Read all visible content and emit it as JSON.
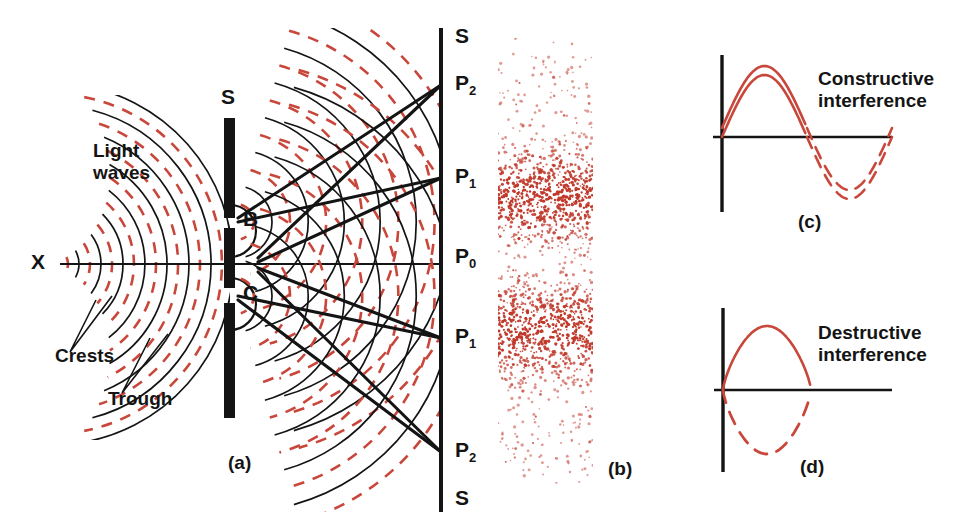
{
  "figure": {
    "background": "#ffffff",
    "ink": "#141414",
    "wave_red": "#c9463a",
    "stipple_red": "#c0392b"
  },
  "panel_a": {
    "caption": "(a)",
    "source_label": "X",
    "barrier_label_top": "S",
    "light_waves_label": "Light\nwaves",
    "crests_label": "Crests",
    "trough_label": "Trough",
    "slit_upper_label": "B",
    "slit_lower_label": "C",
    "screen_labels": [
      {
        "text": "S",
        "sub": "",
        "y": 38
      },
      {
        "text": "P",
        "sub": "2",
        "y": 85
      },
      {
        "text": "P",
        "sub": "1",
        "y": 178
      },
      {
        "text": "P",
        "sub": "0",
        "y": 258
      },
      {
        "text": "P",
        "sub": "1",
        "y": 338
      },
      {
        "text": "P",
        "sub": "2",
        "y": 452
      },
      {
        "text": "S",
        "sub": "",
        "y": 500
      }
    ],
    "geometry": {
      "source_x": 52,
      "axis_y": 264,
      "barrier_x": 230,
      "barrier_top": 118,
      "barrier_bottom": 418,
      "slit_b_y": 222,
      "slit_c_y": 296,
      "screen_x": 441,
      "screen_top": 28,
      "screen_bottom": 512,
      "wavefront_spacing": 22
    }
  },
  "panel_b": {
    "caption": "(b)",
    "description": "Stippled interference fringe pattern on screen",
    "geometry": {
      "x": 498,
      "y": 38,
      "width": 95,
      "height": 448
    },
    "bright_bands": [
      {
        "center_y": 196,
        "half_height": 34
      },
      {
        "center_y": 330,
        "half_height": 34
      }
    ]
  },
  "panel_c": {
    "caption": "(c)",
    "label": "Constructive\ninterference",
    "geometry": {
      "axis_x": 722,
      "axis_top": 55,
      "axis_bottom": 212,
      "baseline_y": 137,
      "baseline_end": 892
    }
  },
  "panel_d": {
    "caption": "(d)",
    "label": "Destructive\ninterference",
    "geometry": {
      "axis_x": 723,
      "axis_top": 308,
      "axis_bottom": 472,
      "baseline_y": 390,
      "baseline_end": 892
    }
  },
  "chart_data": {
    "type": "line",
    "panels": [
      {
        "id": "a",
        "caption": "(a)",
        "description": "Plane/circular light waves from source X strike barrier S-S with two slits B and C; circular wavefronts from the slits overlap and reach screen S-S at points P0, P1, P1, P2, P2.",
        "annotations": [
          "X",
          "Light waves",
          "Crests",
          "Trough",
          "S",
          "B",
          "C",
          "P0",
          "P1",
          "P2"
        ]
      },
      {
        "id": "b",
        "caption": "(b)",
        "description": "Photographic fringe pattern: alternating bright and dark bands of red stipple.",
        "bright_band_count": 2
      },
      {
        "id": "c",
        "caption": "(c)",
        "description": "Two in-phase waves superposing: both curves rise together (solid crest) and fall together (dashed trough).",
        "phase_difference_deg": 0,
        "series": [
          {
            "name": "wave-1",
            "style": "solid-then-dashed",
            "amplitude": 62,
            "phase_offset_px": 0
          },
          {
            "name": "wave-2",
            "style": "solid-then-dashed",
            "amplitude": 62,
            "phase_offset_px": 9
          }
        ]
      },
      {
        "id": "d",
        "caption": "(d)",
        "description": "Two anti-phase waves superposing: solid crest above axis cancels dashed trough below axis.",
        "phase_difference_deg": 180,
        "series": [
          {
            "name": "wave-1",
            "style": "solid",
            "amplitude": 64,
            "phase_offset_px": 0
          },
          {
            "name": "wave-2",
            "style": "dashed",
            "amplitude": -64,
            "phase_offset_px": 0
          }
        ]
      }
    ]
  }
}
